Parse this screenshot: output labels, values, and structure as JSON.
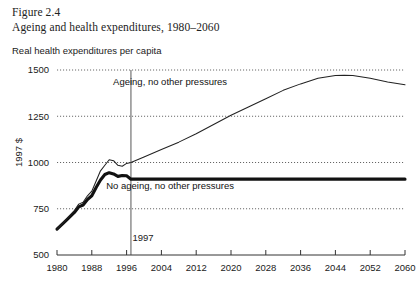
{
  "figure": {
    "number": "Figure 2.4",
    "title": "Ageing and health expenditures, 1980–2060",
    "subtitle": "Real health expenditures per capita"
  },
  "chart_data": {
    "type": "line",
    "title": "Ageing and health expenditures, 1980–2060",
    "subtitle": "Real health expenditures per capita",
    "xlabel": "",
    "ylabel": "1997 $",
    "xlim": [
      1980,
      2060
    ],
    "ylim": [
      500,
      1500
    ],
    "grid": true,
    "legend_position": "inline-annotation",
    "xticks": [
      1980,
      1988,
      1996,
      2004,
      2012,
      2020,
      2028,
      2036,
      2044,
      2052,
      2060
    ],
    "xtick_labels": [
      "1980",
      "1988",
      "1996",
      "2004",
      "2012",
      "2020",
      "2028",
      "2036",
      "2044",
      "2052",
      "2060"
    ],
    "yticks": [
      500,
      750,
      1000,
      1250,
      1500
    ],
    "ytick_labels": [
      "500",
      "750",
      "1000",
      "1250",
      "1500"
    ],
    "annotations": [
      {
        "text": "Ageing, no other pressures",
        "x": 2006,
        "y": 1420
      },
      {
        "text": "No ageing, no other pressures",
        "x": 2006,
        "y": 855
      },
      {
        "text": "1997",
        "x": 1997,
        "y": 590
      }
    ],
    "marker_line": {
      "label": "1997",
      "x": 1997
    },
    "series": [
      {
        "name": "Ageing, no other pressures",
        "style": "thin",
        "x": [
          1980,
          1982,
          1984,
          1985,
          1986,
          1987,
          1988,
          1989,
          1990,
          1991,
          1992,
          1993,
          1994,
          1995,
          1996,
          1997,
          2000,
          2004,
          2008,
          2012,
          2016,
          2020,
          2024,
          2028,
          2032,
          2036,
          2040,
          2044,
          2046,
          2048,
          2052,
          2056,
          2060
        ],
        "values": [
          640,
          690,
          740,
          775,
          785,
          820,
          845,
          900,
          955,
          985,
          1015,
          1010,
          985,
          980,
          995,
          1000,
          1030,
          1070,
          1110,
          1155,
          1205,
          1255,
          1300,
          1345,
          1390,
          1425,
          1455,
          1470,
          1472,
          1470,
          1455,
          1435,
          1420
        ]
      },
      {
        "name": "No ageing, no other pressures",
        "style": "thick",
        "x": [
          1980,
          1982,
          1984,
          1985,
          1986,
          1987,
          1988,
          1989,
          1990,
          1991,
          1992,
          1993,
          1994,
          1995,
          1996,
          1997,
          2004,
          2012,
          2020,
          2028,
          2036,
          2044,
          2052,
          2060
        ],
        "values": [
          640,
          685,
          730,
          760,
          770,
          800,
          820,
          865,
          905,
          935,
          945,
          938,
          925,
          930,
          928,
          910,
          910,
          910,
          910,
          910,
          910,
          910,
          910,
          910
        ]
      }
    ]
  }
}
